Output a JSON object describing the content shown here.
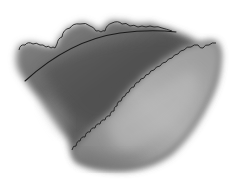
{
  "figure": {
    "colors": {
      "background": "#ffffff",
      "cloud_dark": "#4a4a4a",
      "cloud_mid": "#7a7a7a",
      "cloud_light": "#a8a8a8",
      "cloud_highlight": "#c4c4c4",
      "outline": "#1e1e1e"
    }
  }
}
